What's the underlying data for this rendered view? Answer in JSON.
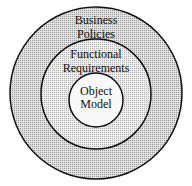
{
  "diagram": {
    "type": "concentric-circles",
    "rings": [
      {
        "id": "outer",
        "label_line1": "Business",
        "label_line2": "Policies",
        "fill": "#c8c8c8"
      },
      {
        "id": "middle",
        "label_line1": "Functional",
        "label_line2": "Requirements",
        "fill": "#dedede"
      },
      {
        "id": "inner",
        "label_line1": "Object",
        "label_line2": "Model",
        "fill": "#f6f6f6"
      }
    ],
    "stroke": "#111111"
  }
}
